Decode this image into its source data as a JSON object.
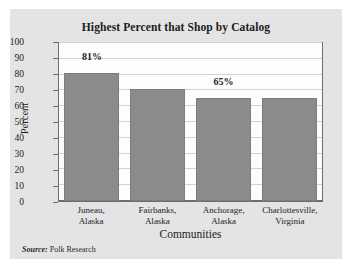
{
  "chart_data": {
    "type": "bar",
    "title": "Highest Percent that Shop by Catalog",
    "xlabel": "Communities",
    "ylabel": "Percent",
    "categories": [
      "Juneau, Alaska",
      "Fairbanks, Alaska",
      "Anchorage, Alaska",
      "Charlottesville, Virginia"
    ],
    "category_lines": [
      [
        "Juneau,",
        "Alaska"
      ],
      [
        "Fairbanks,",
        "Alaska"
      ],
      [
        "Anchorage,",
        "Alaska"
      ],
      [
        "Charlottesville,",
        "Virginia"
      ]
    ],
    "values": [
      81,
      71,
      65,
      65
    ],
    "data_labels": [
      "81%",
      "",
      "65%",
      ""
    ],
    "ylim": [
      0,
      100
    ],
    "yticks": [
      0,
      10,
      20,
      30,
      40,
      50,
      60,
      70,
      80,
      90,
      100
    ],
    "ytick_labels": [
      "0",
      "10",
      "20",
      "30",
      "40",
      "50",
      "60",
      "70",
      "80",
      "90",
      "100"
    ],
    "grid": true,
    "legend": "none",
    "bar_color": "#8b8b8b",
    "plot_background": "#fdfdfd",
    "card_background": "#e4e4e4",
    "frame_color": "#6d6d6d",
    "gridline_color": "#d2d2d2",
    "text_color": "#1c1c1c"
  },
  "source": {
    "label": "Source:",
    "text": "Polk Research"
  }
}
